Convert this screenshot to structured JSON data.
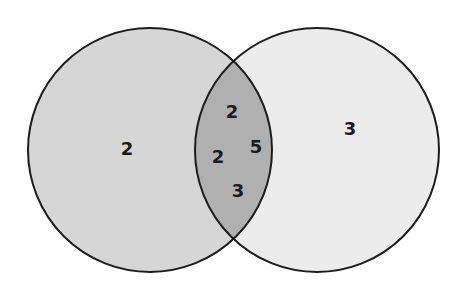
{
  "diagram": {
    "type": "venn",
    "colors": {
      "left_fill": "#d6d6d6",
      "right_fill": "#ececec",
      "overlap_fill": "#b0b0b0",
      "stroke": "#1c1c1c",
      "background": "#ffffff"
    },
    "sets": [
      {
        "id": "left",
        "cx": 150,
        "cy": 150,
        "r": 122
      },
      {
        "id": "right",
        "cx": 317,
        "cy": 150,
        "r": 122
      }
    ],
    "regions": {
      "left_only": {
        "values": [
          {
            "text": "2",
            "x": 127,
            "y": 150
          }
        ]
      },
      "right_only": {
        "values": [
          {
            "text": "3",
            "x": 350,
            "y": 130
          }
        ]
      },
      "overlap": {
        "values": [
          {
            "text": "2",
            "x": 232,
            "y": 113
          },
          {
            "text": "2",
            "x": 218,
            "y": 158
          },
          {
            "text": "5",
            "x": 256,
            "y": 148
          },
          {
            "text": "3",
            "x": 238,
            "y": 192
          }
        ]
      }
    }
  }
}
